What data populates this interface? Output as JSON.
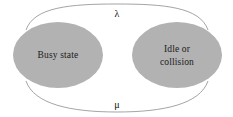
{
  "diagram": {
    "background_color": "#ffffff",
    "node_fill_color": "#b2b2b2",
    "node_text_color": "#1a1a1a",
    "edge_color": "#9a9a9a",
    "edge_label_color": "#111111",
    "nodes": [
      {
        "id": "busy",
        "label_lines": [
          "Busy state"
        ],
        "line1": "Busy state",
        "cx": 58,
        "cy": 55,
        "rx": 45,
        "ry": 33
      },
      {
        "id": "idle",
        "label_lines": [
          "Idle or",
          "collision"
        ],
        "line1": "Idle or",
        "line2": "collision",
        "cx": 177,
        "cy": 55,
        "rx": 45,
        "ry": 33
      }
    ],
    "edges": [
      {
        "id": "busy-to-idle",
        "label": "λ",
        "label_name": "lambda",
        "direction": "top",
        "from": "busy",
        "to": "idle",
        "label_x": 117,
        "label_y": 17
      },
      {
        "id": "idle-to-busy",
        "label": "μ",
        "label_name": "mu",
        "direction": "bottom",
        "from": "idle",
        "to": "busy",
        "label_x": 117,
        "label_y": 108
      }
    ]
  }
}
